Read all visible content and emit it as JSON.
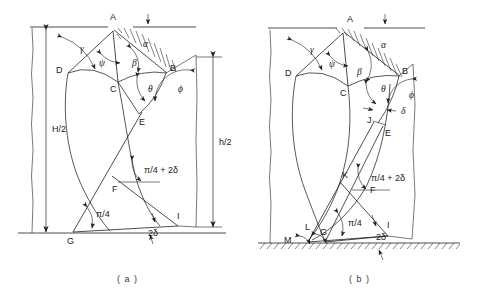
{
  "figure": {
    "type": "engineering-diagram",
    "captions": [
      "( a )",
      "( b )"
    ]
  },
  "diagram_a": {
    "caption": "( a )",
    "points": [
      "A",
      "B",
      "C",
      "D",
      "E",
      "F",
      "G",
      "I"
    ],
    "angles": [
      {
        "symbol": "α",
        "name": "alpha"
      },
      {
        "symbol": "γ",
        "name": "gamma"
      },
      {
        "symbol": "ψ",
        "name": "psi"
      },
      {
        "symbol": "β",
        "name": "beta"
      },
      {
        "symbol": "θ",
        "name": "theta"
      },
      {
        "symbol": "ϕ",
        "name": "phi"
      }
    ],
    "annotations": [
      {
        "text": "π/4 + 2δ",
        "name": "pi-over-4-plus-2delta"
      },
      {
        "text": "π/4",
        "name": "pi-over-4"
      },
      {
        "text": "2δ",
        "name": "two-delta"
      }
    ],
    "dimensions": [
      {
        "label": "H/2",
        "name": "height-H-over-2"
      },
      {
        "label": "h/2",
        "name": "height-h-over-2"
      }
    ]
  },
  "diagram_b": {
    "caption": "( b )",
    "points": [
      "A",
      "B",
      "C",
      "D",
      "E",
      "F",
      "G",
      "I",
      "J",
      "K",
      "L",
      "M"
    ],
    "angles": [
      {
        "symbol": "α",
        "name": "alpha"
      },
      {
        "symbol": "γ",
        "name": "gamma"
      },
      {
        "symbol": "ψ",
        "name": "psi"
      },
      {
        "symbol": "β",
        "name": "beta"
      },
      {
        "symbol": "θ",
        "name": "theta"
      },
      {
        "symbol": "ϕ",
        "name": "phi"
      },
      {
        "symbol": "δ",
        "name": "delta"
      }
    ],
    "annotations": [
      {
        "text": "π/4 + 2δ",
        "name": "pi-over-4-plus-2delta"
      },
      {
        "text": "π/4",
        "name": "pi-over-4"
      },
      {
        "text": "2δ",
        "name": "two-delta"
      }
    ]
  },
  "labels": {
    "a_A": "A",
    "a_B": "B",
    "a_C": "C",
    "a_D": "D",
    "a_E": "E",
    "a_F": "F",
    "a_G": "G",
    "a_I": "I",
    "a_alpha": "α",
    "a_gamma": "γ",
    "a_psi": "ψ",
    "a_beta": "β",
    "a_theta": "θ",
    "a_phi": "ϕ",
    "a_pi4_2d": "π/4 + 2δ",
    "a_pi4": "π/4",
    "a_2d": "2δ",
    "a_H2": "H/2",
    "a_h2": "h/2",
    "a_caption": "( a )",
    "b_A": "A",
    "b_B": "B",
    "b_C": "C",
    "b_D": "D",
    "b_E": "E",
    "b_F": "F",
    "b_G": "G",
    "b_I": "I",
    "b_J": "J",
    "b_K": "K",
    "b_L": "L",
    "b_M": "M",
    "b_alpha": "α",
    "b_gamma": "γ",
    "b_psi": "ψ",
    "b_beta": "β",
    "b_theta": "θ",
    "b_phi": "ϕ",
    "b_delta": "δ",
    "b_pi4_2d": "π/4 + 2δ",
    "b_pi4": "π/4",
    "b_2d": "2δ",
    "b_caption": "( b )"
  },
  "colors": {
    "line": "#202020",
    "text": "#1a1a1a",
    "caption": "#3a3a3a",
    "background": "#ffffff"
  }
}
